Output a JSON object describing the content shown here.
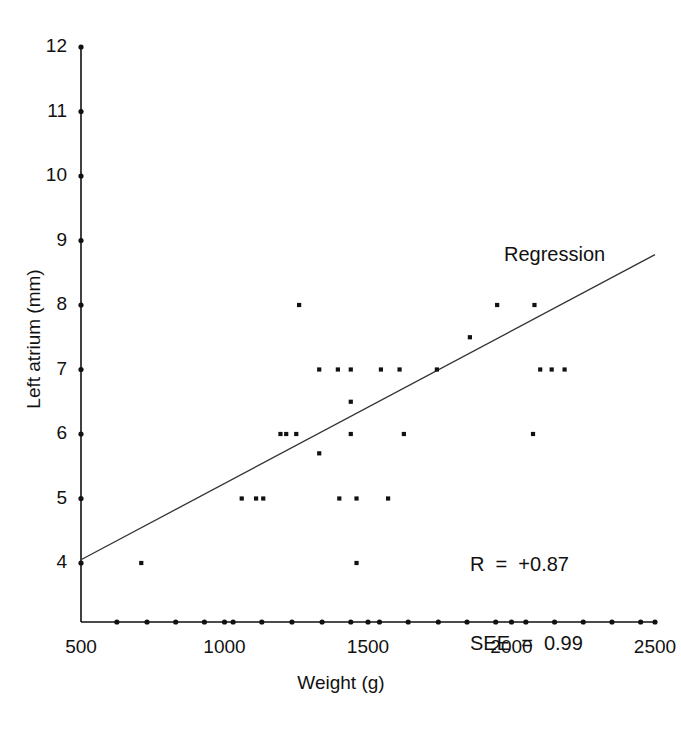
{
  "chart_data": {
    "type": "scatter",
    "title": "",
    "xlabel": "Weight (g)",
    "ylabel": "Left atrium (mm)",
    "xlim": [
      500,
      2500
    ],
    "ylim": [
      3.1,
      12
    ],
    "grid": false,
    "legend": "none",
    "x_ticks": [
      500,
      1000,
      1500,
      2000,
      2500
    ],
    "x_tick_labels": [
      "500",
      "1000",
      "1500",
      "2000",
      "2500"
    ],
    "y_ticks": [
      4,
      5,
      6,
      7,
      8,
      9,
      10,
      11,
      12
    ],
    "y_tick_labels": [
      "4",
      "5",
      "6",
      "7",
      "8",
      "9",
      "10",
      "11",
      "12"
    ],
    "x_minor_ticks": [
      625,
      730,
      830,
      930,
      1030,
      1130,
      1235,
      1340,
      1440,
      1540,
      1640,
      1745,
      1845,
      1945,
      2050,
      2150,
      2250,
      2350,
      2450
    ],
    "points": [
      {
        "x": 710,
        "y": 4.0
      },
      {
        "x": 1460,
        "y": 4.0
      },
      {
        "x": 1060,
        "y": 5.0
      },
      {
        "x": 1110,
        "y": 5.0
      },
      {
        "x": 1135,
        "y": 5.0
      },
      {
        "x": 1400,
        "y": 5.0
      },
      {
        "x": 1460,
        "y": 5.0
      },
      {
        "x": 1570,
        "y": 5.0
      },
      {
        "x": 1330,
        "y": 5.7
      },
      {
        "x": 1195,
        "y": 6.0
      },
      {
        "x": 1215,
        "y": 6.0
      },
      {
        "x": 1250,
        "y": 6.0
      },
      {
        "x": 1440,
        "y": 6.0
      },
      {
        "x": 1625,
        "y": 6.0
      },
      {
        "x": 2075,
        "y": 6.0
      },
      {
        "x": 1440,
        "y": 6.5
      },
      {
        "x": 1330,
        "y": 7.0
      },
      {
        "x": 1395,
        "y": 7.0
      },
      {
        "x": 1440,
        "y": 7.0
      },
      {
        "x": 1545,
        "y": 7.0
      },
      {
        "x": 1610,
        "y": 7.0
      },
      {
        "x": 1740,
        "y": 7.0
      },
      {
        "x": 2100,
        "y": 7.0
      },
      {
        "x": 2140,
        "y": 7.0
      },
      {
        "x": 2185,
        "y": 7.0
      },
      {
        "x": 1855,
        "y": 7.5
      },
      {
        "x": 1260,
        "y": 8.0
      },
      {
        "x": 1950,
        "y": 8.0
      },
      {
        "x": 2080,
        "y": 8.0
      }
    ],
    "regression_line": {
      "label": "Regression",
      "x_start": 500,
      "y_start": 4.05,
      "x_end": 2500,
      "y_end": 8.78
    },
    "annotations": {
      "r_label": "R  =  +0.87",
      "see_label": "SEE  =  0.99"
    },
    "colors": {
      "axis": "#111111",
      "point": "#111111",
      "line": "#333333",
      "background": "#ffffff"
    }
  },
  "figure": {
    "x_axis_title": "Weight (g)",
    "y_axis_title": "Left atrium (mm)",
    "regression_label": "Regression",
    "r_text": "R  =  +0.87",
    "see_text": "SEE  =  0.99"
  }
}
